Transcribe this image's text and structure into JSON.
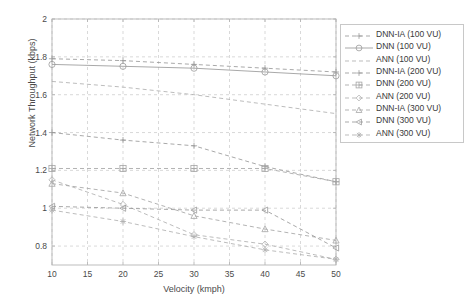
{
  "chart_data": {
    "type": "line",
    "title": "",
    "xlabel": "Velocity (kmph)",
    "ylabel": "Network Throughput (kbps)",
    "xlim": [
      10,
      50
    ],
    "ylim": [
      0.7,
      2
    ],
    "xticks": [
      10,
      15,
      20,
      25,
      30,
      35,
      40,
      45,
      50
    ],
    "yticks": [
      0.8,
      1,
      1.2,
      1.4,
      1.6,
      1.8,
      2
    ],
    "ytick_labels": [
      "0.8",
      "1",
      "1.2",
      "1.4",
      "1.6",
      "1.8",
      "2"
    ],
    "xtick_labels": [
      "10",
      "15",
      "20",
      "25",
      "30",
      "35",
      "40",
      "45",
      "50"
    ],
    "grid": true,
    "grid_style": "dashed",
    "legend_position": "right-outside",
    "x": [
      10,
      20,
      30,
      40,
      50
    ],
    "series": [
      {
        "name": "DNN-IA (100 VU)",
        "marker": "plus",
        "line": "dashed",
        "color": "#9a9a9a",
        "values": [
          1.79,
          1.78,
          1.76,
          1.74,
          1.72
        ]
      },
      {
        "name": "DNN (100 VU)",
        "marker": "circle",
        "line": "solid",
        "color": "#9a9a9a",
        "values": [
          1.76,
          1.75,
          1.74,
          1.72,
          1.7
        ]
      },
      {
        "name": "ANN (100 VU)",
        "marker": "none",
        "line": "dashed",
        "color": "#b0b0b0",
        "values": [
          1.67,
          1.64,
          1.6,
          1.55,
          1.5
        ]
      },
      {
        "name": "DNN-IA (200 VU)",
        "marker": "plus",
        "line": "dashed",
        "color": "#9a9a9a",
        "values": [
          1.4,
          1.36,
          1.33,
          1.22,
          1.14
        ]
      },
      {
        "name": "DNN (200 VU)",
        "marker": "square-plus",
        "line": "dashed",
        "color": "#a5a5a5",
        "values": [
          1.21,
          1.21,
          1.21,
          1.21,
          1.14
        ]
      },
      {
        "name": "ANN (200 VU)",
        "marker": "diamond",
        "line": "dashed",
        "color": "#b0b0b0",
        "values": [
          1.15,
          1.02,
          0.86,
          0.81,
          0.73
        ]
      },
      {
        "name": "DNN-IA (300 VU)",
        "marker": "triangle-up",
        "line": "dashed",
        "color": "#a5a5a5",
        "values": [
          1.13,
          1.08,
          0.96,
          0.89,
          0.83
        ]
      },
      {
        "name": "DNN (300 VU)",
        "marker": "triangle-left",
        "line": "dashed",
        "color": "#9a9a9a",
        "values": [
          1.01,
          1.0,
          0.99,
          0.99,
          0.79
        ]
      },
      {
        "name": "ANN (300 VU)",
        "marker": "asterisk",
        "line": "dashed",
        "color": "#b0b0b0",
        "values": [
          0.99,
          0.93,
          0.85,
          0.78,
          0.73
        ]
      }
    ]
  },
  "axes": {
    "frame_color": "#b5b5b5",
    "grid_color": "#c9c9c9",
    "text_color": "#4a4a4a"
  }
}
